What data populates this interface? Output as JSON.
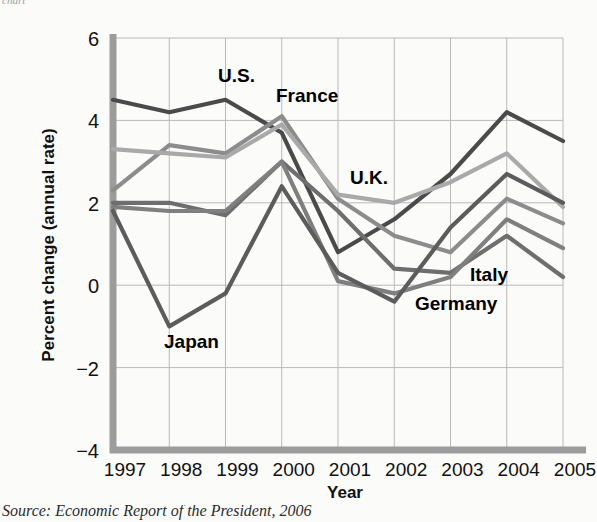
{
  "figure": {
    "top_cut_text": "chart",
    "source_note": "Source: Economic Report of the President, 2006"
  },
  "chart_data": {
    "type": "line",
    "title": "",
    "xlabel": "Year",
    "ylabel": "Percent change (annual rate)",
    "categories": [
      "1997",
      "1998",
      "1999",
      "2000",
      "2001",
      "2002",
      "2003",
      "2004",
      "2005"
    ],
    "x": [
      1997,
      1998,
      1999,
      2000,
      2001,
      2002,
      2003,
      2004,
      2005
    ],
    "ylim": [
      -4,
      6
    ],
    "yticks": [
      6,
      4,
      2,
      0,
      -2,
      -4
    ],
    "ytick_labels": [
      "6",
      "4",
      "2",
      "0",
      "−2",
      "−4"
    ],
    "grid": true,
    "legend": "inline-labels",
    "series": [
      {
        "name": "U.S.",
        "color": "#4a4a4a",
        "label_x": 218,
        "label_y": 82,
        "values": [
          4.5,
          4.2,
          4.5,
          3.7,
          0.8,
          1.6,
          2.7,
          4.2,
          3.5
        ]
      },
      {
        "name": "France",
        "color": "#8c8c8c",
        "label_x": 276,
        "label_y": 102,
        "values": [
          2.3,
          3.4,
          3.2,
          4.1,
          2.1,
          1.2,
          0.8,
          2.1,
          1.5
        ]
      },
      {
        "name": "U.K.",
        "color": "#a9a9a9",
        "label_x": 350,
        "label_y": 184,
        "values": [
          3.3,
          3.2,
          3.1,
          3.9,
          2.2,
          2.0,
          2.5,
          3.2,
          1.9
        ]
      },
      {
        "name": "Italy",
        "color": "#6e6e6e",
        "label_x": 470,
        "label_y": 281,
        "values": [
          2.0,
          2.0,
          1.7,
          3.0,
          1.8,
          0.4,
          0.3,
          1.2,
          0.2
        ]
      },
      {
        "name": "Germany",
        "color": "#7f7f7f",
        "label_x": 415,
        "label_y": 310,
        "values": [
          1.9,
          1.8,
          1.8,
          3.0,
          0.1,
          -0.2,
          0.2,
          1.6,
          0.9
        ]
      },
      {
        "name": "Japan",
        "color": "#5c5c5c",
        "label_x": 164,
        "label_y": 348,
        "values": [
          1.8,
          -1.0,
          -0.2,
          2.4,
          0.3,
          -0.4,
          1.4,
          2.7,
          2.0
        ]
      }
    ]
  }
}
